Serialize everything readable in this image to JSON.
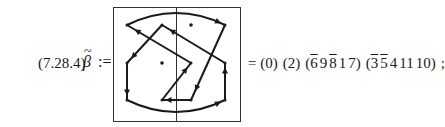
{
  "equation": {
    "number": "(7.28.4)",
    "lhs_symbol": "β",
    "lhs_accent": "~",
    "assign": ":=",
    "equals": "=",
    "cycles": [
      {
        "open": "(",
        "close": ")",
        "entries": [
          {
            "value": "0",
            "bar": false
          }
        ]
      },
      {
        "open": "(",
        "close": ")",
        "entries": [
          {
            "value": "2",
            "bar": false
          }
        ]
      },
      {
        "open": "(",
        "close": ")",
        "entries": [
          {
            "value": "6",
            "bar": true
          },
          {
            "value": "9",
            "bar": false
          },
          {
            "value": "8",
            "bar": true
          },
          {
            "value": "1",
            "bar": false
          },
          {
            "value": "7",
            "bar": false
          }
        ]
      },
      {
        "open": "(",
        "close": ")",
        "entries": [
          {
            "value": "3",
            "bar": true
          },
          {
            "value": "5",
            "bar": true
          },
          {
            "value": "4",
            "bar": false
          },
          {
            "value": "11",
            "bar": false
          },
          {
            "value": "10",
            "bar": false
          }
        ]
      }
    ],
    "terminator": ";"
  },
  "diagram": {
    "colors": {
      "stroke": "#1a1a1a",
      "frame": "#333333"
    },
    "nodes": [
      {
        "id": "a1",
        "col": 0,
        "row": 0,
        "dot_only": false
      },
      {
        "id": "a2",
        "col": 1,
        "row": 0,
        "dot_only": false
      },
      {
        "id": "a3",
        "col": 2,
        "row": 0,
        "dot_only": true
      },
      {
        "id": "a4",
        "col": 3,
        "row": 0,
        "dot_only": false
      },
      {
        "id": "b1",
        "col": 0,
        "row": 1,
        "dot_only": false
      },
      {
        "id": "b2",
        "col": 1,
        "row": 1,
        "dot_only": true
      },
      {
        "id": "b3",
        "col": 2,
        "row": 1,
        "dot_only": false
      },
      {
        "id": "b4",
        "col": 3,
        "row": 1,
        "dot_only": false
      },
      {
        "id": "c1",
        "col": 0,
        "row": 2,
        "dot_only": false
      },
      {
        "id": "c2",
        "col": 1,
        "row": 2,
        "dot_only": false
      },
      {
        "id": "c3",
        "col": 2,
        "row": 2,
        "dot_only": false
      },
      {
        "id": "c4",
        "col": 3,
        "row": 2,
        "dot_only": false
      }
    ],
    "edges": [
      {
        "from": "a1",
        "to": "a4",
        "kind": "arc-top"
      },
      {
        "from": "a4",
        "to": "c3",
        "kind": "line"
      },
      {
        "from": "c3",
        "to": "c2",
        "kind": "line"
      },
      {
        "from": "c2",
        "to": "b3",
        "kind": "line"
      },
      {
        "from": "b3",
        "to": "a1",
        "kind": "line"
      },
      {
        "from": "b1",
        "to": "c1",
        "kind": "line"
      },
      {
        "from": "c1",
        "to": "c4",
        "kind": "arc-bottom"
      },
      {
        "from": "c4",
        "to": "b4",
        "kind": "line"
      },
      {
        "from": "b4",
        "to": "a2",
        "kind": "line"
      },
      {
        "from": "a2",
        "to": "b1",
        "kind": "line"
      }
    ]
  }
}
